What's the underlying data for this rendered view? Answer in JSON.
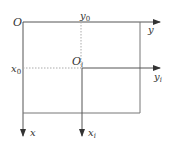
{
  "diagram": {
    "type": "coordinate-frame-translation",
    "line_color": "#555555",
    "dash_color": "#999999",
    "labels": {
      "origin": "O",
      "y_axis": "y",
      "x_axis": "x",
      "y0": "y",
      "y0_sub": "0",
      "x0": "x",
      "x0_sub": "0",
      "origin_i": "O",
      "origin_i_sub": "i",
      "yi": "y",
      "yi_sub": "i",
      "xi": "x",
      "xi_sub": "i"
    }
  }
}
